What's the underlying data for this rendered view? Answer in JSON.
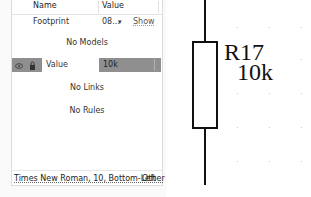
{
  "properties_panel": {
    "header": {
      "name_col": "Name",
      "value_col": "Value"
    },
    "footprint_row": {
      "name": "Footprint",
      "value": "08...",
      "dropdown_icon": "▾",
      "action": "Show"
    },
    "models_empty": "No Models",
    "parameter_row": {
      "eye_icon": "◉",
      "lock_icon": "🔒",
      "name": "Value",
      "value": "10k"
    },
    "links_empty": "No Links",
    "rules_empty": "No Rules",
    "font_setting": "Times New Roman, 10, Bottom-Left",
    "other_link": "Other"
  },
  "schematic": {
    "designator": "R17",
    "comment": "10k",
    "colors": {
      "wire": "#111111",
      "grid_dot": "#c8c8c8",
      "selection": "#8f8f8f"
    }
  }
}
